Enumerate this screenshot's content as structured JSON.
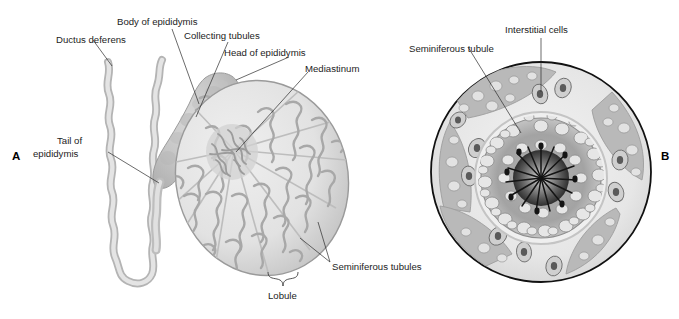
{
  "figure": {
    "panels": [
      {
        "id": "A",
        "letter": "A",
        "caption": "Sagittal section of testis, epididymis and ductus deferens",
        "labels": [
          {
            "name": "ductus-deferens",
            "text": "Ductus deferens"
          },
          {
            "name": "body-of-epididymis",
            "text": "Body of epididymis"
          },
          {
            "name": "collecting-tubules",
            "text": "Collecting tubules"
          },
          {
            "name": "head-of-epididymis",
            "text": "Head of epididymis"
          },
          {
            "name": "mediastinum",
            "text": "Mediastinum"
          },
          {
            "name": "tail-of-epididymis-line1",
            "text": "Tail of"
          },
          {
            "name": "tail-of-epididymis-line2",
            "text": "epididymis"
          },
          {
            "name": "seminiferous-tubules",
            "text": "Seminiferous tubules"
          },
          {
            "name": "lobule",
            "text": "Lobule"
          }
        ]
      },
      {
        "id": "B",
        "letter": "B",
        "caption": "Cross section of seminiferous tubule",
        "labels": [
          {
            "name": "interstitial-cells",
            "text": "Interstitial cells"
          },
          {
            "name": "seminiferous-tubule",
            "text": "Seminiferous tubule"
          }
        ]
      }
    ]
  },
  "colors": {
    "background": "#ffffff",
    "label_text": "#1c1c1c",
    "leader_line": "#2b2b2b",
    "tissue_light": "#e9e9e9",
    "tissue_mid": "#c9c9c9",
    "tissue_dark": "#a6a6a6",
    "outline": "#8f8f8f",
    "circle_outline": "#111111",
    "lumen_dark": "#3a3a3a"
  }
}
